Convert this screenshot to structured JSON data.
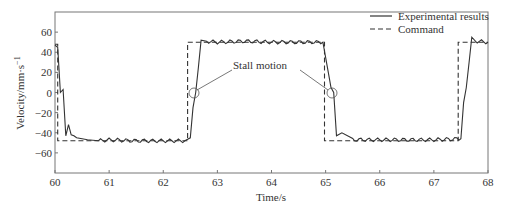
{
  "chart_data": {
    "type": "line",
    "title": "",
    "xlabel": "Time/s",
    "ylabel": "Velocity/mm·s",
    "ylabel_superscript": "−1",
    "xlim": [
      60,
      68
    ],
    "ylim": [
      -80,
      80
    ],
    "xticks": [
      60,
      61,
      62,
      63,
      64,
      65,
      66,
      67,
      68
    ],
    "yticks": [
      -60,
      -40,
      -20,
      0,
      20,
      40,
      60
    ],
    "ytick_labels": [
      "−60",
      "−40",
      "−20",
      "0",
      "20",
      "40",
      "60"
    ],
    "grid": false,
    "legend_position": "upper right",
    "series": [
      {
        "name": "Experimental results",
        "style": "solid",
        "x": [
          60.0,
          60.05,
          60.1,
          60.15,
          60.2,
          60.25,
          60.3,
          60.35,
          60.4,
          60.5,
          60.6,
          60.8,
          61.0,
          61.5,
          62.0,
          62.4,
          62.5,
          62.55,
          62.6,
          62.65,
          62.7,
          62.8,
          63.0,
          63.5,
          64.0,
          64.5,
          64.95,
          65.05,
          65.1,
          65.15,
          65.2,
          65.3,
          65.5,
          66.0,
          66.5,
          67.0,
          67.5,
          67.55,
          67.6,
          67.65,
          67.7,
          67.8,
          68.0
        ],
        "y": [
          47,
          45,
          0,
          3,
          -43,
          -32,
          -42,
          -43,
          -45,
          -46,
          -47,
          -48,
          -47,
          -48,
          -48,
          -48,
          -45,
          -15,
          0,
          25,
          52,
          51,
          50,
          51,
          50,
          50,
          50,
          20,
          5,
          0,
          -43,
          -40,
          -47,
          -47,
          -47,
          -47,
          -46,
          -10,
          5,
          30,
          55,
          51,
          50
        ]
      },
      {
        "name": "Command",
        "style": "dashed",
        "x": [
          60.0,
          60.05,
          60.05,
          62.45,
          62.45,
          64.98,
          64.98,
          67.45,
          67.45,
          68.0
        ],
        "y": [
          48,
          48,
          -48,
          -48,
          50,
          50,
          -48,
          -48,
          50,
          50
        ]
      }
    ],
    "annotations": [
      {
        "text": "Stall motion",
        "targets": [
          {
            "x": 62.58,
            "y": 0
          },
          {
            "x": 65.13,
            "y": 0
          }
        ]
      }
    ]
  },
  "legend": {
    "items": [
      {
        "label": "Experimental results",
        "style": "solid"
      },
      {
        "label": "Command",
        "style": "dashed"
      }
    ]
  },
  "annotation": {
    "label": "Stall motion"
  }
}
